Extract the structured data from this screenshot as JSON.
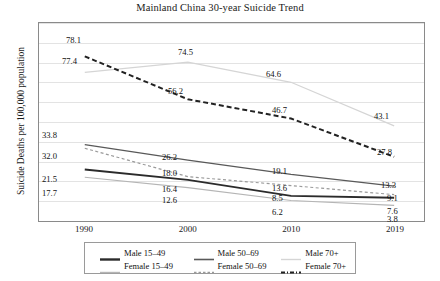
{
  "chart_data": {
    "type": "line",
    "title": "Mainland China 30-year Suicide Trend",
    "xlabel": "",
    "ylabel": "Suicide Deaths per 100,000 population",
    "x": [
      "1990",
      "2000",
      "2010",
      "2019"
    ],
    "categories": [
      "1990",
      "2000",
      "2010",
      "2019"
    ],
    "ylim": [
      0,
      88
    ],
    "grid": true,
    "legend_position": "bottom",
    "series": [
      {
        "name": "Male 15–49",
        "values": [
          21.5,
          16.4,
          8.5,
          7.6
        ],
        "color": "#2b2b2b",
        "style": "solid",
        "width": 1.9
      },
      {
        "name": "Male 50–69",
        "values": [
          33.8,
          26.2,
          19.1,
          13.3
        ],
        "color": "#595959",
        "style": "solid",
        "width": 1.3
      },
      {
        "name": "Male 70+",
        "values": [
          69.5,
          74.5,
          64.6,
          43.1
        ],
        "color": "#d5d5d5",
        "style": "solid",
        "width": 1.3
      },
      {
        "name": "Female 15–49",
        "values": [
          17.7,
          12.6,
          6.2,
          3.8
        ],
        "color": "#b5b5b5",
        "style": "solid",
        "width": 1.2
      },
      {
        "name": "Female 50–69",
        "values": [
          32.0,
          18.0,
          13.6,
          9.1
        ],
        "color": "#9a9a9a",
        "style": "dashed",
        "width": 1.2
      },
      {
        "name": "Female 70+",
        "values": [
          77.4,
          56.2,
          46.7,
          27.8
        ],
        "color": "#222222",
        "style": "dash-dot",
        "width": 2.0
      }
    ],
    "point_labels": [
      {
        "text": "78.1",
        "x": 66,
        "y": 36
      },
      {
        "text": "77.4",
        "x": 62,
        "y": 57
      },
      {
        "text": "74.5",
        "x": 178,
        "y": 48
      },
      {
        "text": "56.2",
        "x": 168,
        "y": 87
      },
      {
        "text": "64.6",
        "x": 266,
        "y": 70
      },
      {
        "text": "46.7",
        "x": 272,
        "y": 106
      },
      {
        "text": "43.1",
        "x": 374,
        "y": 112
      },
      {
        "text": "27.8",
        "x": 377,
        "y": 148
      },
      {
        "text": "33.8",
        "x": 42,
        "y": 131
      },
      {
        "text": "32.0",
        "x": 42,
        "y": 152
      },
      {
        "text": "21.5",
        "x": 42,
        "y": 175
      },
      {
        "text": "17.7",
        "x": 42,
        "y": 189
      },
      {
        "text": "26.2",
        "x": 162,
        "y": 153
      },
      {
        "text": "18.0",
        "x": 162,
        "y": 169
      },
      {
        "text": "16.4",
        "x": 162,
        "y": 185
      },
      {
        "text": "12.6",
        "x": 162,
        "y": 196
      },
      {
        "text": "19.1",
        "x": 272,
        "y": 167
      },
      {
        "text": "13.6",
        "x": 272,
        "y": 184
      },
      {
        "text": "8.5",
        "x": 272,
        "y": 194
      },
      {
        "text": "6.2",
        "x": 272,
        "y": 208
      },
      {
        "text": "13.3",
        "x": 381,
        "y": 181
      },
      {
        "text": "9.1",
        "x": 387,
        "y": 194
      },
      {
        "text": "7.6",
        "x": 387,
        "y": 207
      },
      {
        "text": "3.8",
        "x": 387,
        "y": 215
      }
    ]
  },
  "legend": {
    "rows": [
      [
        {
          "label": "Male 15–49",
          "color": "#2b2b2b",
          "style": "solid",
          "width": 2.4
        },
        {
          "label": "Male 50–69",
          "color": "#595959",
          "style": "solid",
          "width": 1.6
        },
        {
          "label": "Male 70+",
          "color": "#d5d5d5",
          "style": "solid",
          "width": 1.4
        }
      ],
      [
        {
          "label": "Female 15–49",
          "color": "#b5b5b5",
          "style": "solid",
          "width": 1.4
        },
        {
          "label": "Female 50–69",
          "color": "#9a9a9a",
          "style": "dashed",
          "width": 1.3
        },
        {
          "label": "Female 70+",
          "color": "#222222",
          "style": "dash-dot",
          "width": 2.0
        }
      ]
    ]
  },
  "axis": {
    "xticks": [
      "1990",
      "2000",
      "2010",
      "2019"
    ],
    "gridline_count": 11
  }
}
